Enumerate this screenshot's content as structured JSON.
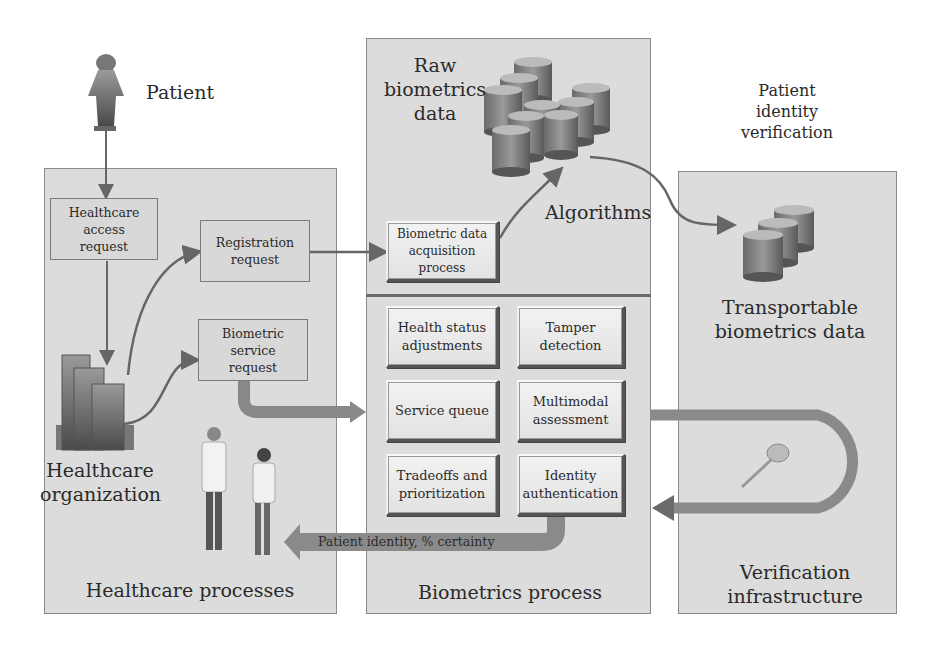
{
  "patient": {
    "label": "Patient",
    "icon": "person-icon"
  },
  "healthcare_panel": {
    "title": "Healthcare processes",
    "access_request": "Healthcare\naccess\nrequest",
    "registration_request": "Registration\nrequest",
    "service_request": "Biometric\nservice\nrequest",
    "organization_label": "Healthcare\norganization",
    "organization_icon": "buildings-icon",
    "staff_icon": "doctors-icon"
  },
  "biometrics_panel": {
    "title": "Biometrics process",
    "raw_data_label": "Raw\nbiometrics\ndata",
    "raw_data_icon": "database-cluster-icon",
    "algorithms_label": "Algorithms",
    "acquisition_box": "Biometric data\nacquisition\nprocess",
    "modules": [
      {
        "label": "Health status\nadjustments"
      },
      {
        "label": "Tamper\ndetection"
      },
      {
        "label": "Service queue"
      },
      {
        "label": "Multimodal\nassessment"
      },
      {
        "label": "Tradeoffs and\nprioritization"
      },
      {
        "label": "Identity\nauthentication"
      }
    ],
    "output_arrow_label": "Patient identity,  % certainty"
  },
  "verification_panel": {
    "header": "Patient\nidentity\nverification",
    "transportable_label": "Transportable\nbiometrics data",
    "transportable_icon": "database-stack-icon",
    "key_icon": "key-icon",
    "title": "Verification\ninfrastructure"
  },
  "colors": {
    "panel_bg": "#dcdcdc",
    "panel_border": "#8a8a8a",
    "arrow": "#6e6e6e",
    "arrow_light": "#9a9a9a",
    "text": "#2a2a2a"
  }
}
